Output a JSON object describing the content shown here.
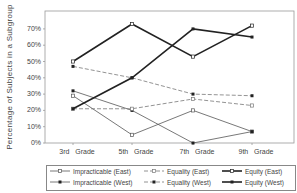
{
  "chart_data": {
    "type": "line",
    "title": "",
    "xlabel": "",
    "ylabel": "Percentage of Subjects in a Subgroup",
    "categories": [
      "3rd Grade",
      "5th Grade",
      "7th Grade",
      "9th Grade"
    ],
    "ylim": [
      0,
      80
    ],
    "yticks": [
      "0%",
      "10%",
      "20%",
      "30%",
      "40%",
      "50%",
      "60%",
      "70%"
    ],
    "grid": false,
    "legend_position": "bottom",
    "series": [
      {
        "name": "Impracticable (East)",
        "values": [
          29,
          5,
          20,
          7
        ],
        "style": "thin-solid",
        "marker": "open-circle"
      },
      {
        "name": "Impracticable (West)",
        "values": [
          32,
          20,
          0,
          7
        ],
        "style": "thin-solid",
        "marker": "filled-square"
      },
      {
        "name": "Equality (East)",
        "values": [
          21,
          21,
          27,
          23
        ],
        "style": "dashed",
        "marker": "open-circle"
      },
      {
        "name": "Equality (West)",
        "values": [
          47,
          40,
          30,
          29
        ],
        "style": "dashed",
        "marker": "filled-square"
      },
      {
        "name": "Equity (East)",
        "values": [
          50,
          73,
          53,
          72
        ],
        "style": "thick-solid",
        "marker": "open-circle"
      },
      {
        "name": "Equity (West)",
        "values": [
          21,
          40,
          70,
          65
        ],
        "style": "thick-solid",
        "marker": "filled-square"
      }
    ]
  },
  "axis": {
    "ylabel": "Percentage of Subjects in a Subgroup",
    "yticks": [
      "0%",
      "10%",
      "20%",
      "30%",
      "40%",
      "50%",
      "60%",
      "70%"
    ],
    "xticks": [
      "3rd Grade",
      "5th Grade",
      "7th Grade",
      "9th Grade"
    ]
  },
  "legend": {
    "items": [
      "Impracticable (East)",
      "Equality (East)",
      "Equity (East)",
      "Impracticable (West)",
      "Equality (West)",
      "Equity (West)"
    ]
  }
}
